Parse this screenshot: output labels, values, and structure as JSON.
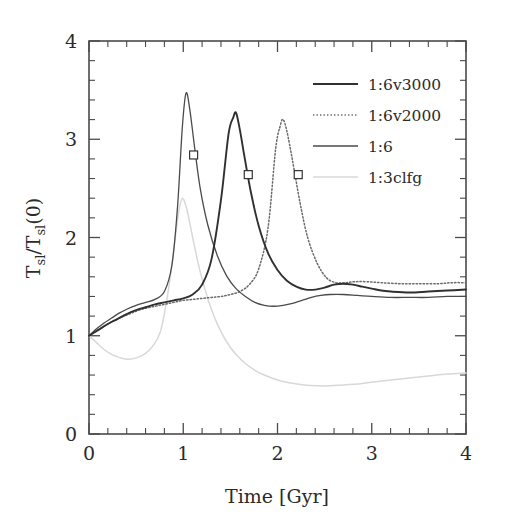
{
  "figure": {
    "title": "",
    "background": "#ffffff"
  },
  "axes": {
    "x_label": "Time [Gyr]",
    "y_label_parts": {
      "num": "T",
      "num_sub": "sl",
      "slash": "/",
      "den": "T",
      "den_sub": "sl",
      "tail": "(0)"
    },
    "y_label_text": "T_sl/T_sl(0)",
    "x_ticklabels": [
      "0",
      "1",
      "2",
      "3",
      "4"
    ],
    "y_ticklabels": [
      "0",
      "1",
      "2",
      "3",
      "4"
    ]
  },
  "legend": {
    "position": "top-right",
    "entries": [
      {
        "label": "1:6v3000",
        "style": "solid",
        "color": "#303030",
        "width": 1.9
      },
      {
        "label": "1:6v2000",
        "style": "dotted",
        "color": "#6a6a6a",
        "width": 1.5
      },
      {
        "label": "1:6",
        "style": "solid",
        "color": "#4a4a4a",
        "width": 1.3
      },
      {
        "label": "1:3clfg",
        "style": "solid",
        "color": "#d8d8d8",
        "width": 1.5
      }
    ]
  },
  "chart_data": {
    "type": "line",
    "title": "",
    "xlabel": "Time [Gyr]",
    "ylabel": "T_sl/T_sl(0)",
    "xlim": [
      0,
      4
    ],
    "ylim": [
      0,
      4
    ],
    "xticks": [
      0,
      1,
      2,
      3,
      4
    ],
    "yticks": [
      0,
      1,
      2,
      3,
      4
    ],
    "x_minor_step": 0.2,
    "y_minor_step": 0.2,
    "grid": false,
    "legend_position": "top-right",
    "markers": {
      "shape": "square",
      "description": "open square markers on the decaying branch of each of the three 1:6 curves",
      "points": [
        {
          "series": "1:6",
          "x": 1.11,
          "y": 2.84
        },
        {
          "series": "1:6v3000",
          "x": 1.69,
          "y": 2.64
        },
        {
          "series": "1:6v2000",
          "x": 2.22,
          "y": 2.64
        }
      ]
    },
    "series": [
      {
        "name": "1:6v3000",
        "style": "solid",
        "color": "#303030",
        "peak": {
          "x": 1.56,
          "y": 3.27
        },
        "x": [
          0.0,
          0.1,
          0.2,
          0.3,
          0.4,
          0.5,
          0.6,
          0.7,
          0.8,
          0.9,
          1.0,
          1.1,
          1.2,
          1.3,
          1.4,
          1.48,
          1.53,
          1.56,
          1.6,
          1.65,
          1.72,
          1.8,
          1.9,
          2.0,
          2.1,
          2.2,
          2.3,
          2.4,
          2.5,
          2.6,
          2.7,
          2.8,
          2.9,
          3.0,
          3.1,
          3.2,
          3.4,
          3.6,
          3.8,
          4.0
        ],
        "y": [
          1.0,
          1.06,
          1.12,
          1.17,
          1.22,
          1.26,
          1.29,
          1.32,
          1.34,
          1.36,
          1.38,
          1.42,
          1.52,
          1.78,
          2.38,
          3.05,
          3.22,
          3.27,
          3.1,
          2.82,
          2.45,
          2.12,
          1.84,
          1.67,
          1.56,
          1.5,
          1.47,
          1.47,
          1.49,
          1.52,
          1.53,
          1.52,
          1.5,
          1.48,
          1.46,
          1.45,
          1.44,
          1.45,
          1.46,
          1.47
        ]
      },
      {
        "name": "1:6v2000",
        "style": "dotted",
        "color": "#6a6a6a",
        "peak": {
          "x": 2.06,
          "y": 3.2
        },
        "x": [
          0.0,
          0.1,
          0.2,
          0.3,
          0.4,
          0.5,
          0.6,
          0.7,
          0.8,
          0.9,
          1.0,
          1.1,
          1.2,
          1.3,
          1.4,
          1.5,
          1.6,
          1.7,
          1.8,
          1.9,
          1.98,
          2.03,
          2.06,
          2.1,
          2.16,
          2.24,
          2.32,
          2.42,
          2.52,
          2.62,
          2.72,
          2.82,
          2.95,
          3.1,
          3.3,
          3.5,
          3.7,
          3.85,
          4.0
        ],
        "y": [
          1.0,
          1.06,
          1.12,
          1.17,
          1.21,
          1.25,
          1.28,
          1.3,
          1.32,
          1.34,
          1.36,
          1.37,
          1.38,
          1.39,
          1.4,
          1.42,
          1.45,
          1.52,
          1.68,
          2.1,
          2.9,
          3.14,
          3.2,
          3.08,
          2.78,
          2.35,
          2.0,
          1.74,
          1.59,
          1.54,
          1.54,
          1.55,
          1.55,
          1.54,
          1.53,
          1.53,
          1.53,
          1.54,
          1.54
        ]
      },
      {
        "name": "1:6",
        "style": "solid",
        "color": "#4a4a4a",
        "peak": {
          "x": 1.03,
          "y": 3.47
        },
        "x": [
          0.0,
          0.08,
          0.16,
          0.24,
          0.32,
          0.4,
          0.5,
          0.6,
          0.7,
          0.8,
          0.88,
          0.94,
          0.99,
          1.03,
          1.07,
          1.12,
          1.18,
          1.26,
          1.36,
          1.46,
          1.56,
          1.66,
          1.76,
          1.86,
          1.96,
          2.06,
          2.16,
          2.26,
          2.36,
          2.46,
          2.56,
          2.7,
          2.85,
          3.0,
          3.2,
          3.4,
          3.6,
          3.8,
          4.0
        ],
        "y": [
          1.0,
          1.07,
          1.13,
          1.18,
          1.23,
          1.27,
          1.31,
          1.34,
          1.37,
          1.45,
          1.72,
          2.32,
          3.12,
          3.47,
          3.3,
          2.92,
          2.5,
          2.13,
          1.82,
          1.61,
          1.48,
          1.4,
          1.34,
          1.31,
          1.3,
          1.31,
          1.33,
          1.36,
          1.39,
          1.41,
          1.42,
          1.42,
          1.41,
          1.4,
          1.39,
          1.39,
          1.39,
          1.4,
          1.4
        ]
      },
      {
        "name": "1:3clfg",
        "style": "solid",
        "color": "#d8d8d8",
        "peak": {
          "x": 0.99,
          "y": 2.4
        },
        "dip": {
          "x": 0.42,
          "y": 0.76
        },
        "x": [
          0.0,
          0.08,
          0.16,
          0.24,
          0.32,
          0.42,
          0.52,
          0.6,
          0.68,
          0.76,
          0.84,
          0.9,
          0.95,
          0.99,
          1.04,
          1.1,
          1.18,
          1.28,
          1.38,
          1.5,
          1.62,
          1.74,
          1.86,
          2.0,
          2.14,
          2.28,
          2.42,
          2.56,
          2.7,
          2.86,
          3.02,
          3.2,
          3.4,
          3.6,
          3.8,
          4.0
        ],
        "y": [
          1.0,
          0.93,
          0.86,
          0.81,
          0.78,
          0.76,
          0.78,
          0.82,
          0.9,
          1.05,
          1.45,
          1.88,
          2.25,
          2.4,
          2.28,
          2.0,
          1.65,
          1.32,
          1.08,
          0.88,
          0.75,
          0.66,
          0.6,
          0.55,
          0.52,
          0.5,
          0.49,
          0.49,
          0.5,
          0.51,
          0.53,
          0.55,
          0.57,
          0.59,
          0.61,
          0.62
        ]
      }
    ]
  }
}
